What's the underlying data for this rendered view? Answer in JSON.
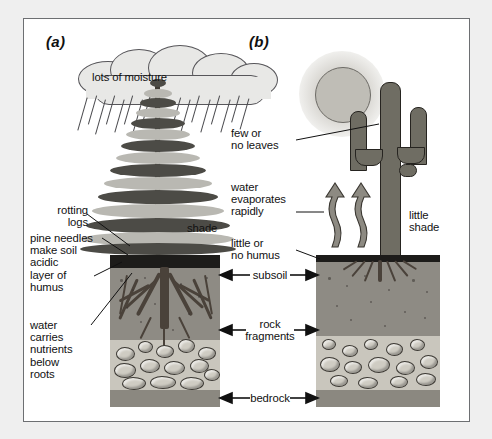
{
  "figure": {
    "type": "diagram",
    "background_color": "#efefef",
    "frame_color": "#6d6f72"
  },
  "panels": [
    {
      "id": "a",
      "letter": "(a)",
      "scene": "coniferous forest, rainy climate",
      "labels": [
        {
          "name": "lots-of-moisture",
          "text": "lots of moisture"
        },
        {
          "name": "rotting-logs",
          "text": "rotting\nlogs"
        },
        {
          "name": "pine-needles",
          "text": "pine needles\nmake soil\nacidic"
        },
        {
          "name": "layer-of-humus",
          "text": "layer of\nhumus"
        },
        {
          "name": "water-carries-nutrients",
          "text": "water\ncarries\nnutrients\nbelow\nroots"
        },
        {
          "name": "shade",
          "text": "shade"
        }
      ]
    },
    {
      "id": "b",
      "letter": "(b)",
      "scene": "saguaro cactus, desert climate",
      "labels": [
        {
          "name": "few-or-no-leaves",
          "text": "few or\nno leaves"
        },
        {
          "name": "water-evaporates-rapidly",
          "text": "water\nevaporates\nrapidly"
        },
        {
          "name": "little-or-no-humus",
          "text": "little or\nno humus"
        },
        {
          "name": "little-shade",
          "text": "little\nshade"
        }
      ]
    }
  ],
  "shared_horizon_labels": [
    {
      "name": "subsoil",
      "text": "subsoil"
    },
    {
      "name": "rock-fragments",
      "text": "rock\nfragments"
    },
    {
      "name": "bedrock",
      "text": "bedrock"
    }
  ],
  "colors": {
    "humus": "#1d1c1a",
    "subsoil": "#8e8b84",
    "rock_fragments": "#c9c6bd",
    "bedrock": "#8b8880",
    "ink": "#111111",
    "paper": "#ffffff"
  }
}
